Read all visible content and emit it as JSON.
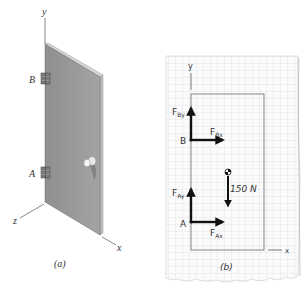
{
  "panel_a": {
    "caption": "(a)",
    "axes": {
      "y": "y",
      "z": "z",
      "x": "x"
    },
    "hinges": [
      {
        "label": "B"
      },
      {
        "label": "A"
      }
    ],
    "object": "door with knob",
    "colors": {
      "door_face": "#9a9a9a",
      "door_edge": "#c8c8c8",
      "axis": "#555555"
    }
  },
  "panel_b": {
    "caption": "(b)",
    "axes": {
      "y": "y",
      "x": "x"
    },
    "points": [
      {
        "label": "B"
      },
      {
        "label": "A"
      }
    ],
    "forces": [
      {
        "label": "F",
        "sub": "By",
        "direction": "up"
      },
      {
        "label": "F",
        "sub": "Bx",
        "direction": "right"
      },
      {
        "label": "F",
        "sub": "Ay",
        "direction": "up"
      },
      {
        "label": "F",
        "sub": "Ax",
        "direction": "right"
      },
      {
        "label": "150 N",
        "direction": "down"
      }
    ],
    "colors": {
      "paper": "#fbfbfb",
      "grid": "#d6d9de",
      "arrow": "#111111",
      "outline": "#555555"
    }
  }
}
